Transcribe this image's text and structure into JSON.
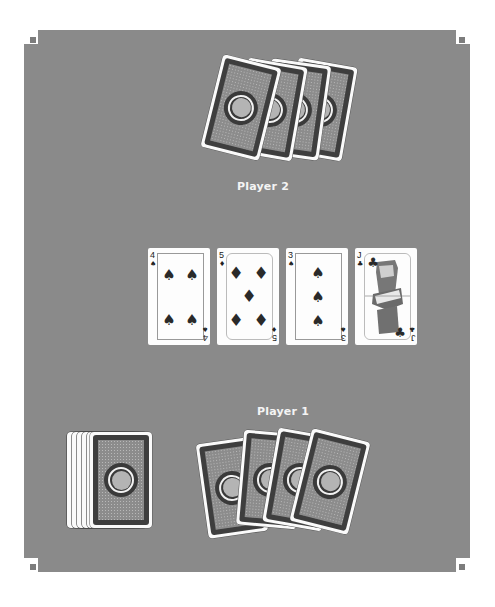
{
  "game": {
    "type": "card-table",
    "table_color": "#8a8a8a"
  },
  "players": [
    {
      "name": "Player 2",
      "position": "top",
      "hand_count": 4,
      "hand_visible": false
    },
    {
      "name": "Player 1",
      "position": "bottom",
      "hand_count": 4,
      "hand_visible": false
    }
  ],
  "labels": {
    "player2": "Player 2",
    "player1": "Player 1"
  },
  "community_cards": [
    {
      "rank": "4",
      "suit": "spades",
      "suit_symbol": "♠"
    },
    {
      "rank": "5",
      "suit": "diamonds",
      "suit_symbol": "♦"
    },
    {
      "rank": "3",
      "suit": "spades",
      "suit_symbol": "♠"
    },
    {
      "rank": "J",
      "suit": "clubs",
      "suit_symbol": "♣"
    }
  ],
  "deck": {
    "visible_edges": 5,
    "face": "down"
  },
  "icons": {
    "spade": "♠",
    "diamond": "♦",
    "club": "♣"
  }
}
